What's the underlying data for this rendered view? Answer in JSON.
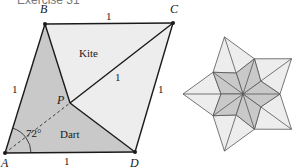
{
  "title": "Exercise 31",
  "colors": {
    "dart_fill": "#c9c9c9",
    "kite_fill": "#ededed",
    "line": "#1a1a1a",
    "star_line": "#555555"
  },
  "left_figure": {
    "vertices": {
      "A": {
        "label": "A",
        "x": 5,
        "y": 153
      },
      "B": {
        "label": "B",
        "x": 45,
        "y": 24
      },
      "C": {
        "label": "C",
        "x": 173,
        "y": 23
      },
      "D": {
        "label": "D",
        "x": 135,
        "y": 152
      },
      "P": {
        "label": "P",
        "x": 70,
        "y": 103
      }
    },
    "region_labels": {
      "kite": "Kite",
      "dart": "Dart"
    },
    "angle_label": "72°",
    "side_labels": {
      "top": "1",
      "left": "1",
      "right": "1",
      "bottom": "1",
      "diagonal": "1"
    }
  },
  "right_figure": {
    "description": "Star of five darts surrounded by five kites",
    "center": {
      "x": 243,
      "y": 94
    },
    "star_tip_radius": 37,
    "concave_radius": 22,
    "kite_tip_radius": 60
  }
}
